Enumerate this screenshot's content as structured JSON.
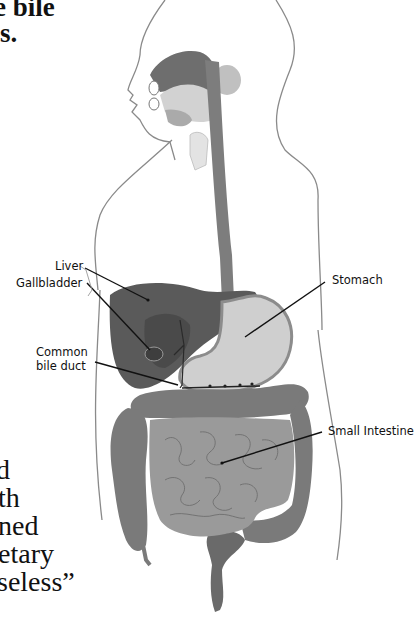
{
  "document": {
    "text_fragments_top": [
      {
        "text": "e bile",
        "bold": true
      },
      {
        "text": "s.",
        "bold": true,
        "suffix": "."
      }
    ],
    "text_fragments_bottom": [
      "d",
      "th",
      "ned",
      "etary",
      "seless”"
    ]
  },
  "figure": {
    "labels": {
      "liver": "Liver",
      "gallbladder": "Gallbladder",
      "common_bile_duct_line1": "Common",
      "common_bile_duct_line2": "bile duct",
      "stomach": "Stomach",
      "small_intestine": "Small Intestine"
    },
    "colors": {
      "outline": "#8a8a8a",
      "organ_dark": "#5a5a5a",
      "organ_mid": "#8c8c8c",
      "organ_light": "#c8c8c8",
      "intestine": "#9a9a9a",
      "colon": "#7a7a7a"
    }
  }
}
